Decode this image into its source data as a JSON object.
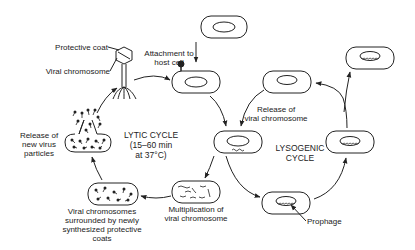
{
  "diagram": {
    "title_lytic": [
      "LYTIC CYCLE",
      "(15–60 min",
      "at 37°C)"
    ],
    "title_lysogenic": [
      "LYSOGENIC",
      "CYCLE"
    ],
    "labels": {
      "protective_coat": "Protective coat",
      "viral_chromosome": "Viral chromosome",
      "attachment": [
        "Attachment to",
        "host cell"
      ],
      "release_viral_chromosome": [
        "Release of",
        "viral chromosome"
      ],
      "release_new_virus": [
        "Release of",
        "new virus",
        "particles"
      ],
      "multiplication": [
        "Multiplication of",
        "viral chromosome"
      ],
      "viral_chromosomes_surrounded": [
        "Viral chromosomes",
        "surrounded by newly",
        "synthesized protective",
        "coats"
      ],
      "prophage": "Prophage"
    },
    "colors": {
      "stroke": "#222222",
      "background": "#ffffff"
    }
  }
}
